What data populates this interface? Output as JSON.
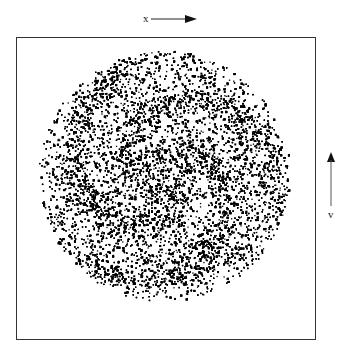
{
  "figure": {
    "x_axis": {
      "label": "x",
      "direction": "right"
    },
    "v_axis": {
      "label": "v",
      "direction": "up"
    }
  },
  "chart_data": {
    "type": "scatter",
    "title": "",
    "xlabel": "x",
    "ylabel": "v",
    "pattern": "spiral phase-space disc with winding filaments",
    "grid": false,
    "legend": null,
    "disc": {
      "center_px": [
        163,
        175
      ],
      "radius_px": 125
    },
    "spiral_arms": 3,
    "colors": {
      "points": "#000000",
      "background": "#ffffff",
      "frame": "#333333"
    }
  }
}
